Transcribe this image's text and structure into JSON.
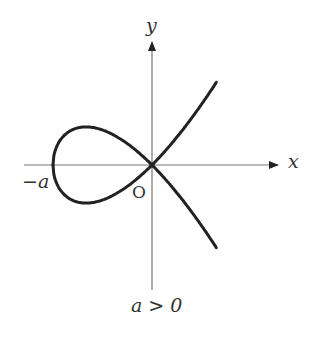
{
  "diagram": {
    "type": "plane-curve",
    "curve_equation": "y^2 = x^2 (x + a) / a",
    "origin_px": [
      152,
      165
    ],
    "a_px": 99,
    "x_range": [
      -1,
      0.65
    ],
    "axis_color": "#777777",
    "curve_color": "#222222",
    "labels": {
      "y_axis": "y",
      "x_axis": "x",
      "neg_a": "−a",
      "origin": "O",
      "condition": "a > 0"
    }
  }
}
